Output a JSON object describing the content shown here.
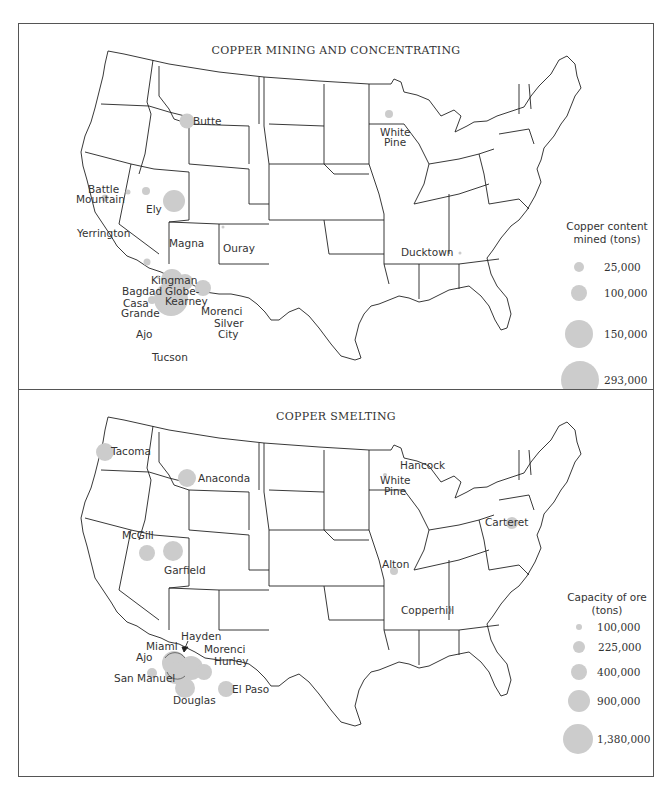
{
  "colors": {
    "bubble": "#cccccc",
    "border": "#555555",
    "text": "#333333",
    "state_line": "#222222"
  },
  "mining": {
    "title": "COPPER MINING AND CONCENTRATING",
    "legend_title_1": "Copper content",
    "legend_title_2": "mined (tons)",
    "legend": [
      {
        "value": "25,000"
      },
      {
        "value": "100,000"
      },
      {
        "value": "150,000"
      },
      {
        "value": "293,000"
      }
    ],
    "sites": [
      {
        "name": "Butte"
      },
      {
        "name": "White"
      },
      {
        "name": "Pine"
      },
      {
        "name": "Battle"
      },
      {
        "name": "Mountain"
      },
      {
        "name": "Ely"
      },
      {
        "name": "Yerrington"
      },
      {
        "name": "Magna"
      },
      {
        "name": "Ouray"
      },
      {
        "name": "Kingman"
      },
      {
        "name": "Bagdad"
      },
      {
        "name": "Globe-"
      },
      {
        "name": "Kearney"
      },
      {
        "name": "Casa"
      },
      {
        "name": "Grande"
      },
      {
        "name": "Morenci"
      },
      {
        "name": "Silver"
      },
      {
        "name": "City"
      },
      {
        "name": "Ajo"
      },
      {
        "name": "Tucson"
      },
      {
        "name": "Ducktown"
      }
    ]
  },
  "smelting": {
    "title": "COPPER SMELTING",
    "legend_title_1": "Capacity of ore",
    "legend_title_2": "(tons)",
    "legend": [
      {
        "value": "100,000"
      },
      {
        "value": "225,000"
      },
      {
        "value": "400,000"
      },
      {
        "value": "900,000"
      },
      {
        "value": "1,380,000"
      }
    ],
    "sites": [
      {
        "name": "Tacoma"
      },
      {
        "name": "Anaconda"
      },
      {
        "name": "Hancock"
      },
      {
        "name": "White"
      },
      {
        "name": "Pine"
      },
      {
        "name": "McGill"
      },
      {
        "name": "Garfield"
      },
      {
        "name": "Carteret"
      },
      {
        "name": "Alton"
      },
      {
        "name": "Copperhill"
      },
      {
        "name": "Miami"
      },
      {
        "name": "Hayden"
      },
      {
        "name": "Ajo"
      },
      {
        "name": "Morenci"
      },
      {
        "name": "Hurley"
      },
      {
        "name": "San Manuel"
      },
      {
        "name": "Douglas"
      },
      {
        "name": "El Paso"
      }
    ]
  }
}
